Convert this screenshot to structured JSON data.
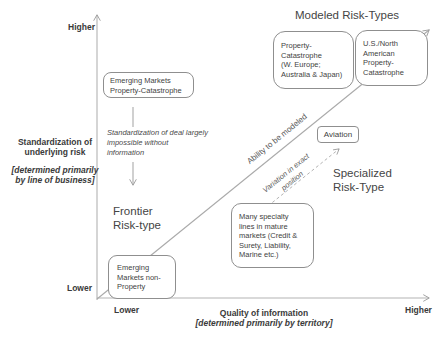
{
  "title": "Modeled Risk-Types",
  "colors": {
    "line": "#a0a0a0",
    "box_border": "#8f8f8f",
    "text": "#3f3f3f"
  },
  "y_axis": {
    "top_label": "Higher",
    "bottom_label": "Lower",
    "label": "Standardization of\nunderlying risk",
    "sublabel": "[determined primarily\nby line of business]"
  },
  "x_axis": {
    "left_label": "Lower",
    "right_label": "Higher",
    "label": "Quality of information",
    "sublabel": "[determined primarily by territory]"
  },
  "boxes": {
    "emerging_property_cat": "Emerging Markets\nProperty-Catastrophe",
    "property_cat_europe": "Property-\nCatastrophe\n(W. Europe;\nAustralia & Japan)",
    "us_north_american": "U.S./North\nAmerican\nProperty-\nCatastrophe",
    "aviation": "Aviation",
    "specialty_lines": "Many specialty\nlines in mature\nmarkets (Credit &\nSurety, Liability,\nMarine etc.)",
    "emerging_non_property": "Emerging\nMarkets non-\nProperty"
  },
  "annotations": {
    "standardization_note": "Standardization of deal largely\nimpossible without\ninformation",
    "frontier_zone": "Frontier\nRisk-type",
    "specialized_zone": "Specialized\nRisk-Type",
    "ability_arrow": "Ability to be modeled",
    "variation_arrow": "Variation in exact\nposition"
  }
}
